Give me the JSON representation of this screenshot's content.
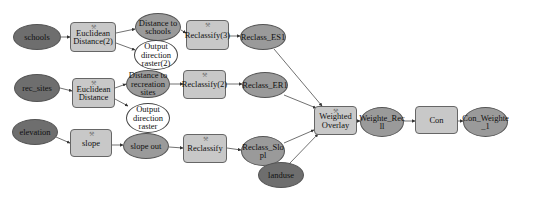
{
  "diagram": {
    "type": "model-builder-flowchart",
    "colors": {
      "input_data": "#6e6e6e",
      "derived_data": "#9a9a9a",
      "tool": "#c8c8c8",
      "output_white": "#ffffff",
      "connector": "#333333"
    },
    "nodes": {
      "schools": "schools",
      "euclid2": "Euclidean Distance(2)",
      "dist_schools": "Distance to schools",
      "outdir2": "Output direction raster(2)",
      "reclass3": "Reclassify(3)",
      "reclass_es1": "Reclass_ES1",
      "rec_sites": "rec_sites",
      "euclid": "Euclidean Distance",
      "dist_rec": "Distance to recreation sites",
      "outdir": "Output direction raster",
      "reclass2": "Reclassify(2)",
      "reclass_er1": "Reclass_ER1",
      "elevation": "elevation",
      "slope": "slope",
      "slope_out": "slope out",
      "reclassify": "Reclassify",
      "reclass_slopl": "Reclass_Slo pl",
      "landuse": "landuse",
      "weighted_overlay": "Weighted Overlay",
      "weighte_recll": "Weighte_Rec ll",
      "con": "Con",
      "con_weighte_1": "Con_Weighte _1"
    },
    "edges": [
      [
        "schools",
        "euclid2"
      ],
      [
        "euclid2",
        "dist_schools"
      ],
      [
        "euclid2",
        "outdir2"
      ],
      [
        "dist_schools",
        "reclass3"
      ],
      [
        "reclass3",
        "reclass_es1"
      ],
      [
        "reclass_es1",
        "weighted_overlay"
      ],
      [
        "rec_sites",
        "euclid"
      ],
      [
        "euclid",
        "dist_rec"
      ],
      [
        "euclid",
        "outdir"
      ],
      [
        "dist_rec",
        "reclass2"
      ],
      [
        "reclass2",
        "reclass_er1"
      ],
      [
        "reclass_er1",
        "weighted_overlay"
      ],
      [
        "elevation",
        "slope"
      ],
      [
        "slope",
        "slope_out"
      ],
      [
        "slope_out",
        "reclassify"
      ],
      [
        "reclassify",
        "reclass_slopl"
      ],
      [
        "reclass_slopl",
        "weighted_overlay"
      ],
      [
        "landuse",
        "weighted_overlay"
      ],
      [
        "weighted_overlay",
        "weighte_recll"
      ],
      [
        "weighte_recll",
        "con"
      ],
      [
        "con",
        "con_weighte_1"
      ]
    ]
  }
}
